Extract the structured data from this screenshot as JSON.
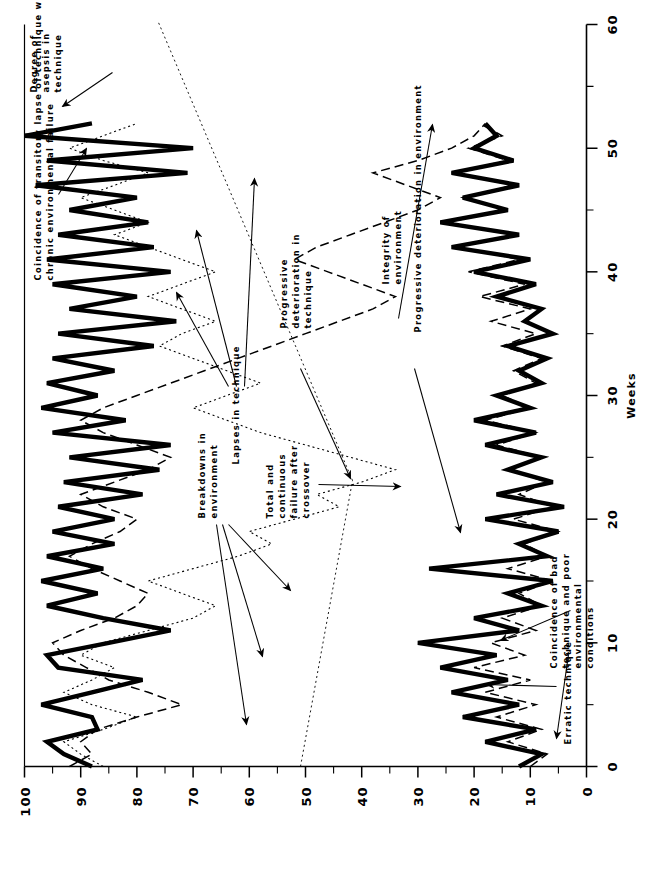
{
  "figure": {
    "orientation": "rotated-90-clockwise",
    "background": "#ffffff",
    "ink": "#000000"
  },
  "chart_data": {
    "type": "line",
    "title": "",
    "xlabel": "Weeks",
    "ylabel": "",
    "xlim": [
      0,
      60
    ],
    "ylim": [
      0,
      100
    ],
    "xticks": [
      0,
      10,
      20,
      30,
      40,
      50,
      60
    ],
    "xticklabels": [
      "0",
      "10",
      "20",
      "30",
      "40",
      "50",
      "60"
    ],
    "yticks": [
      0,
      10,
      20,
      30,
      40,
      50,
      60,
      70,
      80,
      90,
      100
    ],
    "yticklabels": [
      "0",
      "10",
      "20",
      "30",
      "40",
      "50",
      "60",
      "70",
      "80",
      "90",
      "100"
    ],
    "grid": false,
    "legend": "none (series identified by arrow annotations)",
    "x": [
      0,
      1,
      2,
      3,
      4,
      5,
      6,
      7,
      8,
      9,
      10,
      11,
      12,
      13,
      14,
      15,
      16,
      17,
      18,
      19,
      20,
      21,
      22,
      23,
      24,
      25,
      26,
      27,
      28,
      29,
      30,
      31,
      32,
      33,
      34,
      35,
      36,
      37,
      38,
      39,
      40,
      41,
      42,
      43,
      44,
      45,
      46,
      47,
      48,
      49,
      50,
      51,
      52
    ],
    "series": [
      {
        "name": "Degree of asepsis in technique",
        "style": "thick-solid",
        "color": "#000000",
        "linewidth": 4.2,
        "values": [
          88,
          93,
          96,
          87,
          88,
          97,
          88,
          79,
          94,
          96,
          85,
          74,
          86,
          96,
          87,
          97,
          86,
          96,
          84,
          95,
          84,
          94,
          79,
          93,
          76,
          92,
          74,
          95,
          82,
          97,
          87,
          96,
          84,
          95,
          77,
          94,
          73,
          92,
          80,
          95,
          74,
          96,
          77,
          94,
          78,
          92,
          80,
          98,
          71,
          96,
          70,
          100,
          88
        ]
      },
      {
        "name": "Erratic technique / chronic environmental failure",
        "style": "dashed",
        "color": "#000000",
        "linewidth": 1.4,
        "values": [
          92,
          88,
          90,
          87,
          80,
          72,
          78,
          85,
          89,
          93,
          95,
          90,
          84,
          80,
          78,
          83,
          88,
          92,
          88,
          83,
          80,
          86,
          90,
          84,
          78,
          74,
          80,
          86,
          90,
          86,
          80,
          74,
          68,
          62,
          56,
          50,
          44,
          38,
          34,
          40,
          46,
          52,
          48,
          42,
          36,
          30,
          26,
          32,
          38,
          30,
          24,
          20,
          18
        ]
      },
      {
        "name": "Progressive deterioration in technique / lapses in technique",
        "style": "dotted",
        "color": "#000000",
        "linewidth": 1.1,
        "values": [
          86,
          90,
          93,
          86,
          80,
          88,
          93,
          88,
          84,
          90,
          86,
          78,
          70,
          66,
          72,
          78,
          70,
          62,
          56,
          60,
          52,
          44,
          48,
          40,
          34,
          42,
          50,
          58,
          64,
          70,
          64,
          58,
          64,
          70,
          76,
          72,
          66,
          72,
          78,
          72,
          66,
          72,
          78,
          84,
          78,
          84,
          90,
          84,
          78,
          86,
          92,
          86,
          80
        ]
      },
      {
        "name": "Integrity of environment",
        "style": "thick-solid",
        "color": "#000000",
        "linewidth": 4.2,
        "values": [
          12,
          8,
          18,
          9,
          22,
          12,
          24,
          14,
          26,
          16,
          30,
          12,
          20,
          8,
          14,
          6,
          28,
          7,
          12,
          5,
          18,
          4,
          16,
          6,
          14,
          8,
          18,
          9,
          20,
          10,
          16,
          8,
          12,
          7,
          14,
          6,
          11,
          8,
          16,
          9,
          20,
          10,
          24,
          12,
          26,
          14,
          22,
          12,
          24,
          13,
          20,
          16,
          18
        ]
      },
      {
        "name": "Progressive deterioration in environment",
        "style": "dashed-lower",
        "color": "#000000",
        "linewidth": 1.4,
        "values": [
          10,
          7,
          14,
          8,
          16,
          9,
          18,
          10,
          20,
          11,
          17,
          9,
          15,
          8,
          12,
          6,
          14,
          7,
          11,
          5,
          13,
          6,
          12,
          7,
          14,
          8,
          16,
          9,
          18,
          10,
          15,
          9,
          13,
          8,
          15,
          9,
          17,
          10,
          19,
          11,
          21,
          12,
          23,
          13,
          25,
          14,
          22,
          13,
          24,
          14,
          21,
          15,
          19
        ]
      }
    ]
  },
  "axes": {
    "x_axis_title": "Weeks",
    "x_tick_labels": [
      "0",
      "10",
      "20",
      "30",
      "40",
      "50",
      "60"
    ],
    "y_tick_labels": [
      "100",
      "90",
      "80",
      "70",
      "60",
      "50",
      "40",
      "30",
      "20",
      "10",
      "0"
    ]
  },
  "annotations": [
    {
      "id": "coincidence-transitory-lapse",
      "lines": [
        "Coincidence of transitory lapse of technique with",
        "chronic environmental failure"
      ],
      "text": "Coincidence of transitory lapse of technique with chronic environmental failure"
    },
    {
      "id": "degree-of-asepsis",
      "lines": [
        "Degree of",
        "asepsis in",
        "technique"
      ],
      "text": "Degree of asepsis in technique"
    },
    {
      "id": "lapses-in-technique",
      "lines": [
        "Lapses in technique"
      ],
      "text": "Lapses in technique"
    },
    {
      "id": "progressive-deterioration-technique",
      "lines": [
        "Progressive",
        "deterioration in",
        "technique"
      ],
      "text": "Progressive deterioration in technique"
    },
    {
      "id": "integrity-of-environment",
      "lines": [
        "Integrity of",
        "environment"
      ],
      "text": "Integrity of environment"
    },
    {
      "id": "progressive-deterioration-environment",
      "lines": [
        "Progressive deterioration in environment"
      ],
      "text": "Progressive deterioration in environment"
    },
    {
      "id": "breakdowns-in-environment",
      "lines": [
        "Breakdowns in",
        "environment"
      ],
      "text": "Breakdowns in environment"
    },
    {
      "id": "total-continuous-failure",
      "lines": [
        "Total and",
        "continuous",
        "failure after",
        "crossover"
      ],
      "text": "Total and continuous failure after crossover"
    },
    {
      "id": "erratic-technique",
      "lines": [
        "Erratic technique"
      ],
      "text": "Erratic technique"
    },
    {
      "id": "coincidence-bad-technique",
      "lines": [
        "Coincidence of bad",
        "technique and poor",
        "environmental",
        "conditions"
      ],
      "text": "Coincidence of bad technique and poor environmental conditions"
    }
  ]
}
